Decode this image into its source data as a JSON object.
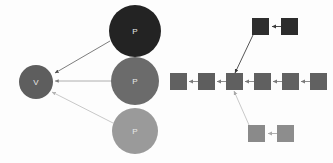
{
  "diagram": {
    "background_color": "#fdfdfd",
    "edge_color_dark": "#5a5a5a",
    "edge_color_mid": "#9a9a9a",
    "edge_color_light": "#c6c6c6",
    "label_color": "#e8e8e8"
  },
  "left_graph": {
    "name": "radial-graph",
    "center_node": {
      "label": "V",
      "color": "#5e5e5e",
      "cx": 36,
      "cy": 82,
      "r": 17
    },
    "leaf_nodes": [
      {
        "label": "P",
        "color": "#232323",
        "cx": 135,
        "cy": 31,
        "r": 26
      },
      {
        "label": "P",
        "color": "#6b6b6b",
        "cx": 135,
        "cy": 81,
        "r": 24
      },
      {
        "label": "P",
        "color": "#9a9a9a",
        "cx": 135,
        "cy": 131,
        "r": 23
      }
    ],
    "edges": [
      {
        "from": "P-dark",
        "to": "V",
        "color": "#6e6e6e"
      },
      {
        "from": "P-mid",
        "to": "V",
        "color": "#a5a5a5"
      },
      {
        "from": "P-light",
        "to": "V",
        "color": "#c2c2c2"
      }
    ]
  },
  "right_graph": {
    "name": "square-tree",
    "square_size": 17,
    "nodes": [
      {
        "id": "m1",
        "x": 170,
        "y": 73,
        "color": "#616161",
        "row": "middle"
      },
      {
        "id": "m2",
        "x": 198,
        "y": 73,
        "color": "#5e5e5e",
        "row": "middle"
      },
      {
        "id": "m3",
        "x": 226,
        "y": 73,
        "color": "#606060",
        "row": "middle"
      },
      {
        "id": "m4",
        "x": 254,
        "y": 73,
        "color": "#606060",
        "row": "middle"
      },
      {
        "id": "m5",
        "x": 282,
        "y": 73,
        "color": "#616161",
        "row": "middle"
      },
      {
        "id": "m6",
        "x": 310,
        "y": 73,
        "color": "#616161",
        "row": "middle"
      },
      {
        "id": "t1",
        "x": 252,
        "y": 18,
        "color": "#2e2e2e",
        "row": "top"
      },
      {
        "id": "t2",
        "x": 281,
        "y": 18,
        "color": "#2c2c2c",
        "row": "top"
      },
      {
        "id": "b1",
        "x": 248,
        "y": 125,
        "color": "#8a8a8a",
        "row": "bottom"
      },
      {
        "id": "b2",
        "x": 277,
        "y": 125,
        "color": "#8d8d8d",
        "row": "bottom"
      }
    ],
    "edges": [
      {
        "from": "m2",
        "to": "m1",
        "color": "#8d8d8d"
      },
      {
        "from": "m3",
        "to": "m2",
        "color": "#8d8d8d"
      },
      {
        "from": "m4",
        "to": "m3",
        "color": "#8d8d8d"
      },
      {
        "from": "m5",
        "to": "m4",
        "color": "#8d8d8d"
      },
      {
        "from": "m6",
        "to": "m5",
        "color": "#8d8d8d"
      },
      {
        "from": "t2",
        "to": "t1",
        "color": "#4a4a4a"
      },
      {
        "from": "t1",
        "to": "m3",
        "color": "#555555"
      },
      {
        "from": "b2",
        "to": "b1",
        "color": "#b0b0b0"
      },
      {
        "from": "b1",
        "to": "m3",
        "color": "#c9c9c9"
      }
    ]
  }
}
